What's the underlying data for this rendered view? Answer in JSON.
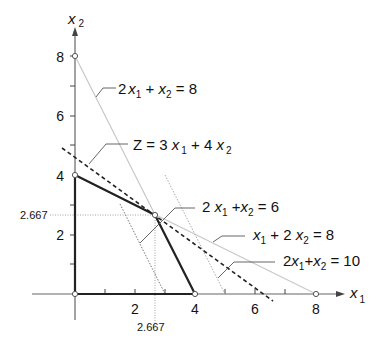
{
  "diagram": {
    "type": "linear-programming-graph",
    "axes": {
      "x_label": "x",
      "x_label_sub": "1",
      "y_label": "x",
      "y_label_sub": "2",
      "x_ticks": [
        "2",
        "4",
        "6",
        "8"
      ],
      "y_ticks": [
        "2",
        "4",
        "6",
        "8"
      ],
      "x_range": [
        0,
        9
      ],
      "y_range": [
        0,
        9
      ]
    },
    "feasible_region": {
      "vertices": [
        [
          0,
          0
        ],
        [
          0,
          4
        ],
        [
          2.667,
          2.667
        ],
        [
          4,
          0
        ]
      ]
    },
    "optimum": {
      "x1": 2.667,
      "x2": 2.667,
      "x1_label": "2.667",
      "x2_label": "2.667"
    },
    "constraints": [
      {
        "id": "c1",
        "label_parts": [
          "2",
          "x",
          "1",
          " + ",
          "x",
          "2",
          " = 8"
        ],
        "points": [
          [
            0,
            8
          ],
          [
            4,
            0
          ]
        ],
        "style": "light-solid"
      },
      {
        "id": "c2",
        "label_parts": [
          "2 ",
          "x",
          "1",
          " +",
          "x",
          "2",
          "  = 6"
        ],
        "points": [
          [
            1.5,
            3
          ],
          [
            3,
            0
          ]
        ],
        "style": "fine-dotted"
      },
      {
        "id": "c3",
        "label_parts": [
          "",
          "x",
          "1",
          " + 2 ",
          "x",
          "2",
          " = 8"
        ],
        "points": [
          [
            0,
            4
          ],
          [
            8,
            0
          ]
        ],
        "style": "light-solid"
      },
      {
        "id": "c4",
        "label_parts": [
          "2",
          "x",
          "1",
          "+",
          "x",
          "2",
          "  = 10"
        ],
        "points": [
          [
            3,
            4
          ],
          [
            5,
            0
          ]
        ],
        "style": "light-dotted"
      }
    ],
    "objective": {
      "label_parts": [
        "Z  = 3 ",
        "x",
        "1",
        " + 4 ",
        "x",
        "2"
      ],
      "expression": "Z = 3x1 + 4x2",
      "points": [
        [
          -0.4,
          4.9
        ],
        [
          6.6,
          -0.25
        ]
      ],
      "style": "dashed"
    },
    "labels": {
      "c1": {
        "coef": "2",
        "var1": "x",
        "sub1": "1",
        "op": " + ",
        "var2": "x",
        "sub2": "2",
        "rhs": " = 8"
      },
      "c2": {
        "coef": "2 ",
        "var1": "x",
        "sub1": "1",
        "op": " +",
        "var2": "x",
        "sub2": "2",
        "rhs": "  = 6"
      },
      "c3": {
        "coef": "",
        "var1": "x",
        "sub1": "1",
        "op": " + 2 ",
        "var2": "x",
        "sub2": "2",
        "rhs": " = 8"
      },
      "c4": {
        "coef": "2",
        "var1": "x",
        "sub1": "1",
        "op": "+",
        "var2": "x",
        "sub2": "2",
        "rhs": "  = 10"
      },
      "z": {
        "lhs": "Z  = 3 ",
        "var1": "x",
        "sub1": "1",
        "op": " + 4 ",
        "var2": "x",
        "sub2": "2"
      }
    },
    "colors": {
      "axis": "#555555",
      "region": "#222222",
      "light_line": "#bdbdbd",
      "dotted_line": "#777777",
      "objective": "#222222",
      "text": "#111111"
    }
  }
}
